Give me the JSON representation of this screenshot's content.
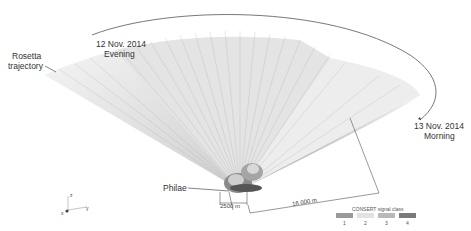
{
  "labels": {
    "evening_date": "12 Nov. 2014",
    "evening_time": "Evening",
    "trajectory_1": "Rosetta",
    "trajectory_2": "trajectory",
    "morning_date": "13 Nov. 2014",
    "morning_time": "Morning",
    "lander": "Philae",
    "scale_short": "2500 m",
    "scale_long": "16 000 m"
  },
  "axes": {
    "z": "z",
    "x": "x",
    "y": "y"
  },
  "legend": {
    "title": "CONSERT signal class",
    "classes": [
      {
        "label": "1",
        "color": "#9a9a9a"
      },
      {
        "label": "2",
        "color": "#e2e2e2"
      },
      {
        "label": "3",
        "color": "#b9b9b9"
      },
      {
        "label": "4",
        "color": "#7a7a7a"
      }
    ]
  }
}
